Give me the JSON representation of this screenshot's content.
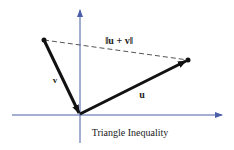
{
  "figure": {
    "caption": "Triangle Inequality",
    "labels": {
      "sum_norm": "‖u + v‖",
      "u": "u",
      "v": "v"
    },
    "colors": {
      "axis": "#4a5fa8",
      "vector": "#111111",
      "dashed": "#555555",
      "text": "#222222"
    }
  }
}
